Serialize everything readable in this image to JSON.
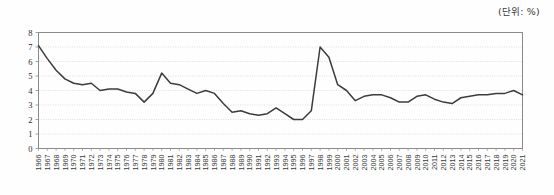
{
  "unit_label": "(단위: %)",
  "colors": {
    "line": "#3c3c3c",
    "frame": "#8a8a8a",
    "grid": "#c8c8c8",
    "text": "#2b2b2b",
    "background": "#fefefe"
  },
  "chart_data": {
    "type": "line",
    "title": "",
    "subtitle": "",
    "xlabel": "",
    "ylabel": "",
    "annotations": [
      "(단위: %)"
    ],
    "grid": true,
    "legend": false,
    "legend_position": "none",
    "ylim": [
      0,
      8
    ],
    "yticks": [
      0,
      1,
      2,
      3,
      4,
      5,
      6,
      7,
      8
    ],
    "ytick_labels": [
      "0",
      "1",
      "2",
      "3",
      "4",
      "5",
      "6",
      "7",
      "8"
    ],
    "categories": [
      "1966",
      "1967",
      "1968",
      "1969",
      "1970",
      "1971",
      "1972",
      "1973",
      "1974",
      "1975",
      "1976",
      "1977",
      "1978",
      "1979",
      "1980",
      "1981",
      "1982",
      "1983",
      "1984",
      "1985",
      "1986",
      "1987",
      "1988",
      "1989",
      "1990",
      "1991",
      "1992",
      "1993",
      "1994",
      "1995",
      "1996",
      "1997",
      "1998",
      "1999",
      "2000",
      "2001",
      "2002",
      "2003",
      "2004",
      "2005",
      "2006",
      "2007",
      "2008",
      "2009",
      "2010",
      "2011",
      "2012",
      "2013",
      "2014",
      "2015",
      "2016",
      "2017",
      "2018",
      "2019",
      "2020",
      "2021"
    ],
    "values": [
      7.1,
      6.2,
      5.4,
      4.8,
      4.5,
      4.4,
      4.5,
      4.0,
      4.1,
      4.1,
      3.9,
      3.8,
      3.2,
      3.8,
      5.2,
      4.5,
      4.4,
      4.1,
      3.8,
      4.0,
      3.8,
      3.1,
      2.5,
      2.6,
      2.4,
      2.3,
      2.4,
      2.8,
      2.4,
      2.0,
      2.0,
      2.6,
      7.0,
      6.3,
      4.4,
      4.0,
      3.3,
      3.6,
      3.7,
      3.7,
      3.5,
      3.2,
      3.2,
      3.6,
      3.7,
      3.4,
      3.2,
      3.1,
      3.5,
      3.6,
      3.7,
      3.7,
      3.8,
      3.8,
      4.0,
      3.7
    ]
  },
  "axes": {
    "y_axis_name": "y-axis",
    "x_axis_name": "x-axis"
  }
}
